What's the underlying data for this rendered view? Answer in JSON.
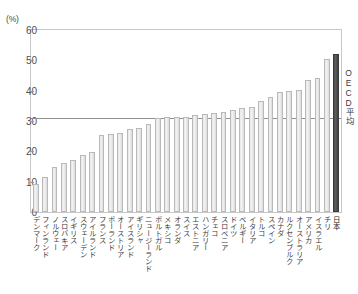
{
  "axis": {
    "unit_label": "(%)",
    "y_ticks": [
      0,
      10,
      20,
      30,
      40,
      50,
      60
    ]
  },
  "annotations": {
    "average_caption": "OECD平均"
  },
  "chart_data": {
    "type": "bar",
    "title": "",
    "xlabel": "",
    "ylabel": "(%)",
    "ylim": [
      0,
      60
    ],
    "grid": false,
    "legend": null,
    "reference_line": {
      "label": "OECD平均",
      "value": 31.0
    },
    "highlight_category": "日本",
    "categories": [
      "デンマーク",
      "フィンランド",
      "ノルウェー",
      "スロバキア",
      "イギリス",
      "スウェーデン",
      "アイルランド",
      "フランス",
      "ポーランド",
      "オーストリア",
      "アイスランド",
      "ギリシャ",
      "ニュージーランド",
      "ポルトガル",
      "メキシコ",
      "オランダ",
      "スイス",
      "エストニア",
      "ハンガリー",
      "チェコ",
      "スロベニア",
      "ドイツ",
      "ベルギー",
      "イタリア",
      "トルコ",
      "スペイン",
      "カナダ",
      "ルクセンブルク",
      "オーストラリア",
      "アメリカ",
      "イスラエル",
      "チリ",
      "日本"
    ],
    "values": [
      9.3,
      11.5,
      14.8,
      16.0,
      17.0,
      18.7,
      19.7,
      25.5,
      25.6,
      26.0,
      27.4,
      27.6,
      29.0,
      31.0,
      31.2,
      31.3,
      31.4,
      32.0,
      32.2,
      32.6,
      33.1,
      33.5,
      34.2,
      34.6,
      36.5,
      38.0,
      39.6,
      40.0,
      40.1,
      43.5,
      44.3,
      50.5,
      52.0
    ]
  }
}
